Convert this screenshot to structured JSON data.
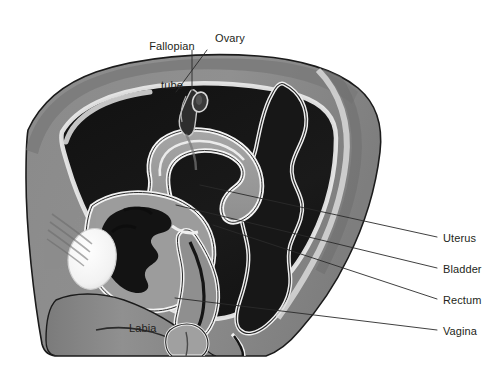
{
  "figure": {
    "kind": "anatomical-illustration",
    "title_cropped": "",
    "background_color": "#ffffff",
    "palette": {
      "body_gray": "#8e8e8e",
      "body_gray_dark": "#6f6f6f",
      "body_gray_light": "#a8a8a8",
      "cavity_black": "#151515",
      "organ_gray": "#9a9a9a",
      "organ_outline_white": "#f2f2f2",
      "bone_white": "#f7f7f7",
      "outline_black": "#1b1b1b",
      "leader_line": "#2a2a2a",
      "text_color": "#231f20"
    }
  },
  "labels": {
    "top": [
      {
        "name": "fallopian-tube",
        "line1": "Fallopian",
        "line2": "tube",
        "x": 162,
        "y": 20,
        "leader": {
          "x1": 192,
          "y1": 50,
          "x2": 192,
          "y2": 92
        }
      },
      {
        "name": "ovary",
        "line1": "Ovary",
        "line2": "",
        "x": 208,
        "y": 36,
        "leader": {
          "x1": 207,
          "y1": 50,
          "x2": 176,
          "y2": 92
        }
      }
    ],
    "inner": [
      {
        "name": "labia",
        "text": "Labia",
        "x": 129,
        "y": 328
      }
    ],
    "right": [
      {
        "name": "uterus",
        "text": "Uterus",
        "x": 443,
        "y": 232,
        "leader": {
          "x1": 200,
          "y1": 185,
          "x2": 437,
          "y2": 237
        }
      },
      {
        "name": "bladder",
        "text": "Bladder",
        "x": 443,
        "y": 263,
        "leader": {
          "x1": 176,
          "y1": 205,
          "x2": 437,
          "y2": 268
        }
      },
      {
        "name": "rectum",
        "text": "Rectum",
        "x": 443,
        "y": 294,
        "leader": {
          "x1": 213,
          "y1": 225,
          "x2": 437,
          "y2": 299
        }
      },
      {
        "name": "vagina",
        "text": "Vagina",
        "x": 443,
        "y": 325,
        "leader": {
          "x1": 175,
          "y1": 298,
          "x2": 437,
          "y2": 330
        }
      }
    ]
  }
}
